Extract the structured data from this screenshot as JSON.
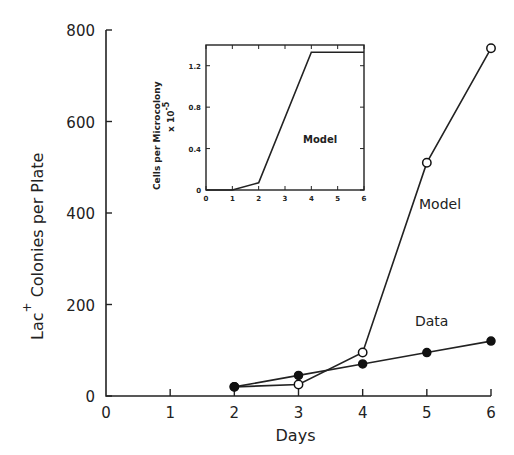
{
  "chart_data": [
    {
      "type": "line",
      "title": "",
      "xlabel": "Days",
      "ylabel": "Lac+ Colonies per Plate",
      "ylabel_main": "Lac",
      "ylabel_sup": "+",
      "ylabel_rest": "Colonies per Plate",
      "xlim": [
        0,
        6
      ],
      "ylim": [
        0,
        800
      ],
      "x_ticks": [
        "0",
        "1",
        "2",
        "3",
        "4",
        "5",
        "6"
      ],
      "y_ticks": [
        "0",
        "200",
        "400",
        "600",
        "800"
      ],
      "grid": false,
      "x": [
        2,
        3,
        4,
        5,
        6
      ],
      "series": [
        {
          "name": "Model",
          "marker": "open-circle",
          "values": [
            20,
            25,
            95,
            510,
            760
          ]
        },
        {
          "name": "Data",
          "marker": "filled-circle",
          "values": [
            20,
            45,
            70,
            95,
            120
          ]
        }
      ],
      "annotations": [
        "Model",
        "Data"
      ]
    },
    {
      "type": "line",
      "title": "",
      "role": "inset",
      "xlabel": "",
      "ylabel": "Cells per Microcolony x 10^-5",
      "ylabel_line1": "Cells per Microcolony",
      "ylabel_line2": "x 10",
      "ylabel_exp": "-5",
      "xlim": [
        0,
        6
      ],
      "ylim": [
        0,
        1.4
      ],
      "x_ticks": [
        "0",
        "1",
        "2",
        "3",
        "4",
        "5",
        "6"
      ],
      "y_ticks": [
        "0",
        "0.4",
        "0.8",
        "1.2"
      ],
      "grid": false,
      "series": [
        {
          "name": "Model",
          "x": [
            0,
            1,
            2,
            4,
            6
          ],
          "values": [
            0,
            0,
            0.07,
            1.33,
            1.33
          ]
        }
      ],
      "annotations": [
        "Model"
      ]
    }
  ]
}
